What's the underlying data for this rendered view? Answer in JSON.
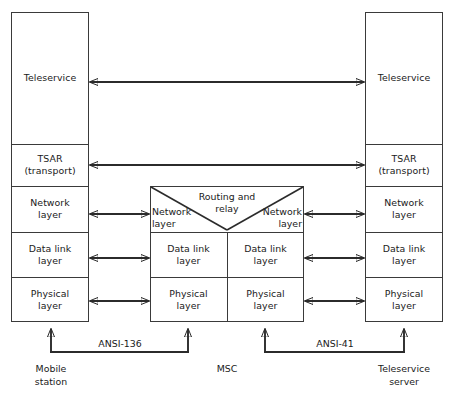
{
  "diagram": {
    "stroke_color": "#2b2b2b",
    "background_color": "#ffffff"
  },
  "left_stack": {
    "caption_line1": "Mobile",
    "caption_line2": "station",
    "layers": [
      {
        "id": "teleservice",
        "label": "Teleservice"
      },
      {
        "id": "tsar",
        "label_line1": "TSAR",
        "label_line2": "(transport)"
      },
      {
        "id": "network",
        "label_line1": "Network",
        "label_line2": "layer"
      },
      {
        "id": "datalink",
        "label_line1": "Data link",
        "label_line2": "layer"
      },
      {
        "id": "physical",
        "label_line1": "Physical",
        "label_line2": "layer"
      }
    ]
  },
  "center_stack": {
    "caption": "MSC",
    "routing_label_line1": "Routing and",
    "routing_label_line2": "relay",
    "left_column": [
      {
        "id": "network-left",
        "label_line1": "Network",
        "label_line2": "layer"
      },
      {
        "id": "datalink-left",
        "label_line1": "Data link",
        "label_line2": "layer"
      },
      {
        "id": "physical-left",
        "label_line1": "Physical",
        "label_line2": "layer"
      }
    ],
    "right_column": [
      {
        "id": "network-right",
        "label_line1": "Network",
        "label_line2": "layer"
      },
      {
        "id": "datalink-right",
        "label_line1": "Data link",
        "label_line2": "layer"
      },
      {
        "id": "physical-right",
        "label_line1": "Physical",
        "label_line2": "layer"
      }
    ]
  },
  "right_stack": {
    "caption_line1": "Teleservice",
    "caption_line2": "server",
    "layers": [
      {
        "id": "teleservice",
        "label": "Teleservice"
      },
      {
        "id": "tsar",
        "label_line1": "TSAR",
        "label_line2": "(transport)"
      },
      {
        "id": "network",
        "label_line1": "Network",
        "label_line2": "layer"
      },
      {
        "id": "datalink",
        "label_line1": "Data link",
        "label_line2": "layer"
      },
      {
        "id": "physical",
        "label_line1": "Physical",
        "label_line2": "layer"
      }
    ]
  },
  "interfaces": {
    "left": "ANSI-136",
    "right": "ANSI-41"
  }
}
